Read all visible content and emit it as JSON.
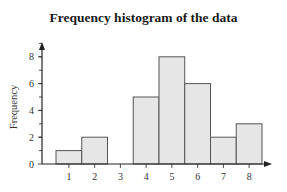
{
  "chart_data": {
    "type": "bar",
    "title": "Frequency histogram of the data",
    "xlabel": "",
    "ylabel": "Frequency",
    "categories": [
      "1",
      "2",
      "3",
      "4",
      "5",
      "6",
      "7",
      "8"
    ],
    "values": [
      1,
      2,
      0,
      5,
      8,
      6,
      2,
      3
    ],
    "ylim": [
      0,
      9
    ],
    "yticks": [
      0,
      2,
      4,
      6,
      8
    ],
    "ytick_labels": [
      "0",
      "2",
      "4",
      "6",
      "8"
    ],
    "grid": false,
    "legend": null,
    "bar_fill": "#e6e6e6",
    "bar_edge": "#555555",
    "axis_color": "#222222"
  }
}
